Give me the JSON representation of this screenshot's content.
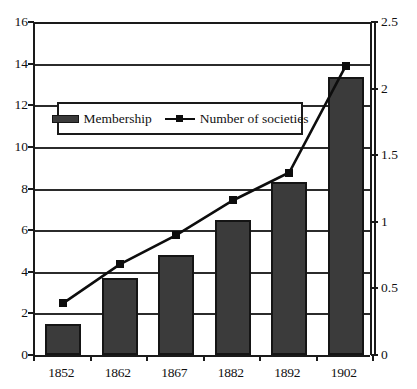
{
  "chart_data": {
    "type": "bar",
    "title": "",
    "subtitle": "",
    "xlabel": "",
    "ylabel": "",
    "categories": [
      "1852",
      "1862",
      "1867",
      "1882",
      "1892",
      "1902"
    ],
    "series": [
      {
        "name": "Membership",
        "type": "bar",
        "axis": "left",
        "values": [
          1.5,
          3.7,
          4.8,
          6.5,
          8.3,
          13.35
        ],
        "color": "#3b3b3b"
      },
      {
        "name": "Number of societies",
        "type": "line",
        "axis": "right",
        "values": [
          0.39,
          0.68,
          0.9,
          1.16,
          1.37,
          2.17
        ],
        "color": "#0d0d0d",
        "marker": "square"
      }
    ],
    "y_left": {
      "label": "",
      "min": 0,
      "max": 16,
      "step": 2,
      "ticks": [
        "0",
        "2",
        "4",
        "6",
        "8",
        "10",
        "12",
        "14",
        "16"
      ]
    },
    "y_right": {
      "label": "",
      "min": 0,
      "max": 2.5,
      "step": 0.5,
      "ticks": [
        "0",
        "0.5",
        "1",
        "1.5",
        "2",
        "2.5"
      ]
    },
    "grid": true,
    "legend": {
      "position": "inside-top-left",
      "entries": [
        {
          "label": "Membership",
          "swatch": "bar-swatch-icon"
        },
        {
          "label": "Number of societies",
          "swatch": "line-marker-icon"
        }
      ]
    }
  }
}
